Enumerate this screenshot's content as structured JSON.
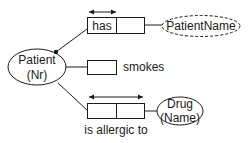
{
  "diagram": {
    "type": "ORM fact-type diagram",
    "entities": [
      {
        "id": "patient",
        "name": "Patient",
        "ref": "(Nr)",
        "kind": "entity-type"
      },
      {
        "id": "patientname",
        "name": "PatientName",
        "kind": "value-type"
      },
      {
        "id": "drug",
        "name": "Drug",
        "ref": "(Name)",
        "kind": "entity-type"
      }
    ],
    "fact_types": [
      {
        "id": "has",
        "reading": "has",
        "roles": 2,
        "uniqueness": "first-role",
        "mandatory": true,
        "connects": [
          "Patient",
          "PatientName"
        ]
      },
      {
        "id": "smokes",
        "reading": "smokes",
        "roles": 1,
        "connects": [
          "Patient"
        ]
      },
      {
        "id": "allergic",
        "reading": "is allergic to",
        "roles": 2,
        "uniqueness": "spanning-both-roles",
        "connects": [
          "Patient",
          "Drug"
        ]
      }
    ],
    "colors": {
      "stroke": "#1a1a1a",
      "background": "#ffffff"
    }
  }
}
